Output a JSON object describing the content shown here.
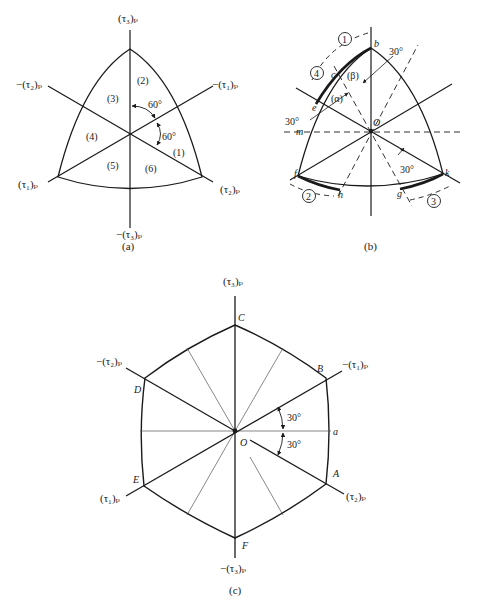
{
  "figure": {
    "panels": [
      {
        "id": "a",
        "caption": "(a)",
        "axis_labels": {
          "tau3_pos": "(τ₃)ₚ",
          "tau3_neg": "−(τ₃)ₚ",
          "tau1_pos": "(τ₁)ₚ",
          "tau1_neg": "−(τ₁)ₚ",
          "tau2_pos": "(τ₂)ₚ",
          "tau2_neg": "−(τ₂)ₚ"
        },
        "regions": [
          "(1)",
          "(2)",
          "(3)",
          "(4)",
          "(5)",
          "(6)"
        ],
        "angles": [
          "60°",
          "60°"
        ]
      },
      {
        "id": "b",
        "caption": "(b)",
        "points": [
          "b",
          "c",
          "e",
          "m",
          "f",
          "h",
          "g",
          "k",
          "O"
        ],
        "regions": [
          "(α)",
          "(β)"
        ],
        "paths": [
          "1",
          "2",
          "3",
          "4"
        ],
        "angles": [
          "30°",
          "30°",
          "30°"
        ]
      },
      {
        "id": "c",
        "caption": "(c)",
        "axis_labels": {
          "tau3_pos": "(τ₃)ₚ",
          "tau3_neg": "−(τ₃)ₚ",
          "tau1_pos": "(τ₁)ₚ",
          "tau1_neg": "−(τ₁)ₚ",
          "tau2_pos": "(τ₂)ₚ",
          "tau2_neg": "−(τ₂)ₚ"
        },
        "vertices": [
          "A",
          "B",
          "C",
          "D",
          "E",
          "F"
        ],
        "points": [
          "O",
          "a"
        ],
        "angles": [
          "30°",
          "30°"
        ]
      }
    ]
  }
}
